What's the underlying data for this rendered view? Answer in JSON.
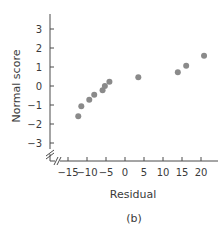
{
  "chart_data": {
    "type": "scatter",
    "title": "",
    "subtitle": "",
    "panel_label": "(b)",
    "xlabel": "Residual",
    "ylabel": "Normal score",
    "xlim": [
      -18,
      24
    ],
    "ylim": [
      -3.6,
      3.6
    ],
    "xticks": [
      -15,
      -10,
      -5,
      0,
      5,
      10,
      15,
      20
    ],
    "yticks": [
      3,
      2,
      1,
      0,
      -1,
      -2,
      -3
    ],
    "xtick_labels": [
      "−15",
      "−10",
      "−5",
      "0",
      "5",
      "10",
      "15",
      "20"
    ],
    "ytick_labels": [
      "3",
      "2",
      "1",
      "0",
      "−1",
      "−2",
      "−3"
    ],
    "grid": false,
    "legend": null,
    "axis_breaks": true,
    "point_color": "#8a8a8a",
    "series": [
      {
        "name": "residuals",
        "x": [
          -12.3,
          -11.5,
          -9.4,
          -8.1,
          -5.9,
          -5.3,
          -4.1,
          3.5,
          13.9,
          16.1,
          20.8
        ],
        "y": [
          -1.59,
          -1.06,
          -0.73,
          -0.46,
          -0.22,
          0.0,
          0.22,
          0.46,
          0.73,
          1.06,
          1.59
        ]
      }
    ]
  }
}
